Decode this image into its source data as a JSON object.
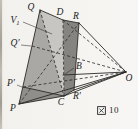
{
  "figure": {
    "caption": {
      "kanji": "図",
      "number": "10",
      "full": "図 10"
    },
    "canvas": {
      "width": 138,
      "height": 129,
      "background": "#f3f2ee"
    },
    "colors": {
      "line": "#2a2a28",
      "face_light": "#c7c6c2",
      "face_medium": "#a9a8a4",
      "face_dark": "#8f8e8a",
      "face_band": "#858480"
    },
    "points": {
      "Q": [
        40,
        10
      ],
      "D": [
        63,
        20
      ],
      "R": [
        79,
        23
      ],
      "O": [
        126,
        72
      ],
      "P": [
        19,
        104
      ],
      "C": [
        64,
        96
      ],
      "Rp": [
        74,
        90
      ],
      "B": [
        63,
        75
      ],
      "Pp": [
        23,
        87
      ],
      "Qp": [
        32,
        46
      ]
    },
    "polygons": [
      {
        "name": "front-face",
        "pts": [
          "Q",
          "D",
          "C",
          "P"
        ],
        "fill": "face_light"
      },
      {
        "name": "mid-face",
        "pts": [
          "Q",
          "C",
          "Pp"
        ],
        "fill": "face_medium"
      },
      {
        "name": "bottom-face",
        "pts": [
          "Pp",
          "P",
          "C"
        ],
        "fill": "face_dark"
      },
      {
        "name": "right-band-face",
        "pts": [
          "D",
          "R",
          "Rp",
          "C"
        ],
        "fill": "face_band"
      }
    ],
    "edges_solid": [
      [
        "Q",
        "D"
      ],
      [
        "D",
        "R"
      ],
      [
        "Q",
        "P"
      ],
      [
        "P",
        "C"
      ],
      [
        "C",
        "Rp"
      ],
      [
        "R",
        "O"
      ],
      [
        "O",
        "Rp"
      ],
      [
        "O",
        "C"
      ],
      [
        "O",
        "P"
      ],
      [
        "O",
        "B"
      ],
      [
        "Pp",
        "C"
      ],
      [
        "R",
        "Rp"
      ]
    ],
    "edges_dashed": [
      [
        "Q",
        "C"
      ],
      [
        "P",
        "R"
      ],
      [
        "Qp",
        "O"
      ],
      [
        "Pp",
        "O"
      ],
      [
        "D",
        "C"
      ],
      [
        "D",
        "O"
      ]
    ],
    "leaders": [
      {
        "name": "v1-leader",
        "x1": 23,
        "y1": 22,
        "x2": 52,
        "y2": 34
      },
      {
        "name": "b-leader",
        "x1": 74,
        "y1": 68,
        "x2": 65,
        "y2": 74
      },
      {
        "name": "q-prime-leader",
        "x1": 21,
        "y1": 45,
        "x2": 31,
        "y2": 46
      },
      {
        "name": "p-prime-leader",
        "x1": 17,
        "y1": 85,
        "x2": 22,
        "y2": 87
      }
    ],
    "labels": [
      {
        "name": "label-Q",
        "text": "Q",
        "x": 31,
        "y": 8
      },
      {
        "name": "label-D",
        "text": "D",
        "x": 60,
        "y": 13
      },
      {
        "name": "label-R",
        "text": "R",
        "x": 76,
        "y": 17
      },
      {
        "name": "label-V1",
        "text": "V",
        "sub": "1",
        "x": 15,
        "y": 21
      },
      {
        "name": "label-Q-prime",
        "text": "Q′",
        "x": 15,
        "y": 44
      },
      {
        "name": "label-B",
        "text": "B",
        "x": 79,
        "y": 67
      },
      {
        "name": "label-P-prime",
        "text": "P′",
        "x": 11,
        "y": 84
      },
      {
        "name": "label-P",
        "text": "P",
        "x": 13,
        "y": 109
      },
      {
        "name": "label-C",
        "text": "C",
        "x": 61,
        "y": 103
      },
      {
        "name": "label-R-prime",
        "text": "R′",
        "x": 77,
        "y": 97
      },
      {
        "name": "label-O",
        "text": "O",
        "x": 129,
        "y": 79
      }
    ]
  }
}
